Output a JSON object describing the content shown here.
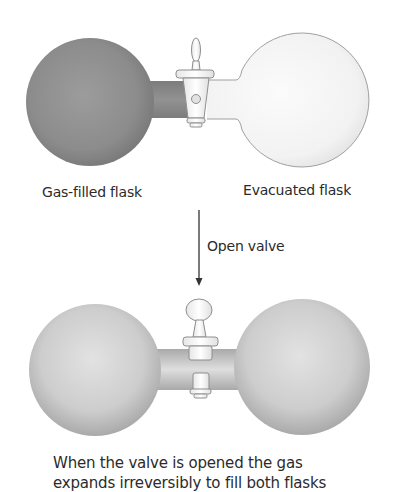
{
  "diagram": {
    "before": {
      "left_flask_label": "Gas-filled flask",
      "right_flask_label": "Evacuated flask",
      "valve_state": "closed",
      "left_flask_fill": "gas",
      "right_flask_fill": "empty"
    },
    "transition": {
      "arrow_direction": "down",
      "label": "Open valve"
    },
    "after": {
      "valve_state": "open",
      "left_flask_fill": "gas",
      "right_flask_fill": "gas"
    },
    "caption": {
      "line1": "When the valve is opened the gas",
      "line2": "expands irreversibly to fill both flasks"
    },
    "colors": {
      "gas_dark": "#8e8e8e",
      "gas_dark_edge": "#7a7a7a",
      "gas_light": "#dcdcdc",
      "gas_light_edge": "#a9a9a9",
      "vacuum": "#f7f7f7",
      "outline": "#9a9a9a",
      "text": "#2b2b2b"
    }
  }
}
